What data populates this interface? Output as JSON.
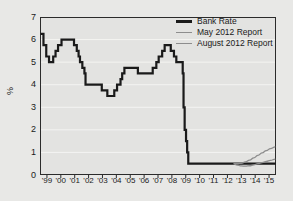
{
  "chart_data": {
    "type": "line",
    "title": "",
    "xlabel": "",
    "ylabel": "%",
    "xlim": [
      1998.5,
      2015.5
    ],
    "ylim": [
      0,
      7
    ],
    "yticks": [
      0,
      1,
      2,
      3,
      4,
      5,
      6,
      7
    ],
    "xticks": [
      1999,
      2000,
      2001,
      2002,
      2003,
      2004,
      2005,
      2006,
      2007,
      2008,
      2009,
      2010,
      2011,
      2012,
      2013,
      2014,
      2015
    ],
    "xticklabels": [
      "'99",
      "'00",
      "'01",
      "'02",
      "'03",
      "'04",
      "'05",
      "'06",
      "'07",
      "'08",
      "'09",
      "'10",
      "'11",
      "'12",
      "'13",
      "'14",
      "'15"
    ],
    "grid": "horizontal",
    "legend_position": "top-right",
    "series": [
      {
        "name": "Bank Rate",
        "style": "step",
        "color": "#1a1a1a",
        "width": 2.2,
        "points": [
          [
            1998.55,
            6.25
          ],
          [
            1998.75,
            6.25
          ],
          [
            1998.75,
            5.75
          ],
          [
            1998.95,
            5.75
          ],
          [
            1998.95,
            5.25
          ],
          [
            1999.15,
            5.25
          ],
          [
            1999.15,
            5.0
          ],
          [
            1999.45,
            5.0
          ],
          [
            1999.45,
            5.25
          ],
          [
            1999.62,
            5.25
          ],
          [
            1999.62,
            5.5
          ],
          [
            1999.8,
            5.5
          ],
          [
            1999.8,
            5.75
          ],
          [
            2000.05,
            5.75
          ],
          [
            2000.05,
            6.0
          ],
          [
            2000.95,
            6.0
          ],
          [
            2000.95,
            5.75
          ],
          [
            2001.15,
            5.75
          ],
          [
            2001.15,
            5.5
          ],
          [
            2001.28,
            5.5
          ],
          [
            2001.28,
            5.25
          ],
          [
            2001.38,
            5.25
          ],
          [
            2001.38,
            5.0
          ],
          [
            2001.55,
            5.0
          ],
          [
            2001.55,
            4.75
          ],
          [
            2001.7,
            4.75
          ],
          [
            2001.7,
            4.5
          ],
          [
            2001.78,
            4.5
          ],
          [
            2001.78,
            4.0
          ],
          [
            2002.95,
            4.0
          ],
          [
            2002.95,
            3.75
          ],
          [
            2003.35,
            3.75
          ],
          [
            2003.35,
            3.5
          ],
          [
            2003.85,
            3.5
          ],
          [
            2003.85,
            3.75
          ],
          [
            2004.05,
            3.75
          ],
          [
            2004.05,
            4.0
          ],
          [
            2004.3,
            4.0
          ],
          [
            2004.3,
            4.25
          ],
          [
            2004.42,
            4.25
          ],
          [
            2004.42,
            4.5
          ],
          [
            2004.58,
            4.5
          ],
          [
            2004.58,
            4.75
          ],
          [
            2005.55,
            4.75
          ],
          [
            2005.55,
            4.5
          ],
          [
            2006.62,
            4.5
          ],
          [
            2006.62,
            4.75
          ],
          [
            2006.88,
            4.75
          ],
          [
            2006.88,
            5.0
          ],
          [
            2007.05,
            5.0
          ],
          [
            2007.05,
            5.25
          ],
          [
            2007.3,
            5.25
          ],
          [
            2007.3,
            5.5
          ],
          [
            2007.48,
            5.5
          ],
          [
            2007.48,
            5.75
          ],
          [
            2007.92,
            5.75
          ],
          [
            2007.92,
            5.5
          ],
          [
            2008.15,
            5.5
          ],
          [
            2008.15,
            5.25
          ],
          [
            2008.32,
            5.25
          ],
          [
            2008.32,
            5.0
          ],
          [
            2008.78,
            5.0
          ],
          [
            2008.78,
            4.5
          ],
          [
            2008.84,
            4.5
          ],
          [
            2008.84,
            3.0
          ],
          [
            2008.92,
            3.0
          ],
          [
            2008.92,
            2.0
          ],
          [
            2009.02,
            2.0
          ],
          [
            2009.02,
            1.5
          ],
          [
            2009.1,
            1.5
          ],
          [
            2009.1,
            1.0
          ],
          [
            2009.18,
            1.0
          ],
          [
            2009.18,
            0.5
          ],
          [
            2015.5,
            0.5
          ]
        ]
      },
      {
        "name": "May 2012 Report",
        "style": "smooth",
        "color": "#8d8d8d",
        "width": 1.3,
        "points": [
          [
            2012.45,
            0.5
          ],
          [
            2012.7,
            0.5
          ],
          [
            2013.0,
            0.52
          ],
          [
            2013.3,
            0.58
          ],
          [
            2013.6,
            0.66
          ],
          [
            2013.9,
            0.76
          ],
          [
            2014.2,
            0.87
          ],
          [
            2014.5,
            0.98
          ],
          [
            2014.8,
            1.08
          ],
          [
            2015.1,
            1.17
          ],
          [
            2015.45,
            1.25
          ]
        ]
      },
      {
        "name": "August 2012 Report",
        "style": "smooth",
        "color": "#8d8d8d",
        "width": 1.3,
        "points": [
          [
            2012.45,
            0.5
          ],
          [
            2012.7,
            0.44
          ],
          [
            2013.0,
            0.4
          ],
          [
            2013.3,
            0.39
          ],
          [
            2013.6,
            0.41
          ],
          [
            2013.9,
            0.45
          ],
          [
            2014.2,
            0.5
          ],
          [
            2014.5,
            0.55
          ],
          [
            2014.8,
            0.6
          ],
          [
            2015.1,
            0.65
          ],
          [
            2015.45,
            0.7
          ]
        ]
      }
    ]
  },
  "legend": {
    "items": [
      {
        "label": "Bank Rate"
      },
      {
        "label": "May 2012 Report"
      },
      {
        "label": "August 2012 Report"
      }
    ]
  }
}
